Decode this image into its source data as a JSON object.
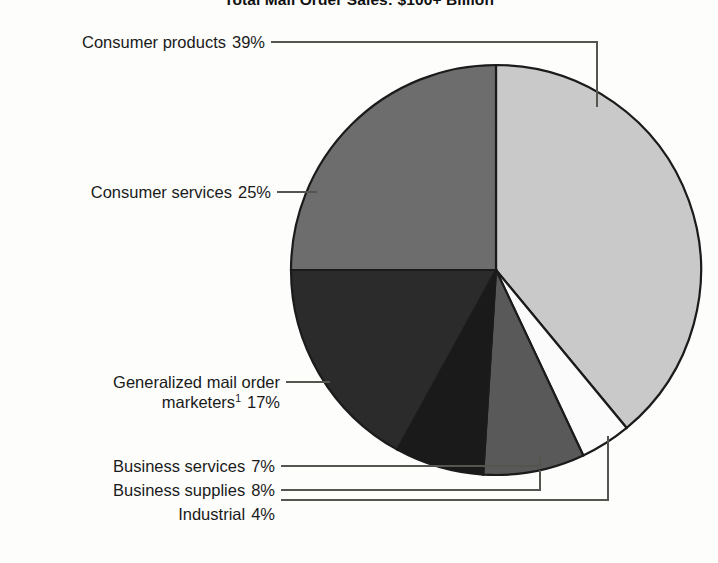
{
  "chart_data": {
    "type": "pie",
    "title": "Total Mail Order Sales: $100+ Billion",
    "xlabel": "",
    "ylabel": "",
    "legend_position": "callout-labels-left",
    "grid": false,
    "units": "percent",
    "start_angle_deg": 0,
    "direction": "clockwise",
    "categories": [
      "Consumer products",
      "Industrial",
      "Business supplies",
      "Business services",
      "Generalized mail order marketers",
      "Consumer services"
    ],
    "values": [
      39,
      4,
      8,
      7,
      17,
      25
    ],
    "slice_colors": [
      "#c9c9c9",
      "#fbfbfb",
      "#595959",
      "#1a1a1a",
      "#2b2b2b",
      "#6d6d6d"
    ],
    "footnotes": [
      "1"
    ]
  },
  "labels": [
    {
      "id": "consumer-products",
      "line1": "Consumer products",
      "line2": "",
      "percent": "39%",
      "footnote": ""
    },
    {
      "id": "consumer-services",
      "line1": "Consumer services",
      "line2": "",
      "percent": "25%",
      "footnote": ""
    },
    {
      "id": "generalized-mail-order-marketers",
      "line1": "Generalized mail order",
      "line2": "marketers",
      "percent": "17%",
      "footnote": "1"
    },
    {
      "id": "business-services",
      "line1": "Business services",
      "line2": "",
      "percent": "7%",
      "footnote": ""
    },
    {
      "id": "business-supplies",
      "line1": "Business supplies",
      "line2": "",
      "percent": "8%",
      "footnote": ""
    },
    {
      "id": "industrial",
      "line1": "Industrial",
      "line2": "",
      "percent": "4%",
      "footnote": ""
    }
  ]
}
